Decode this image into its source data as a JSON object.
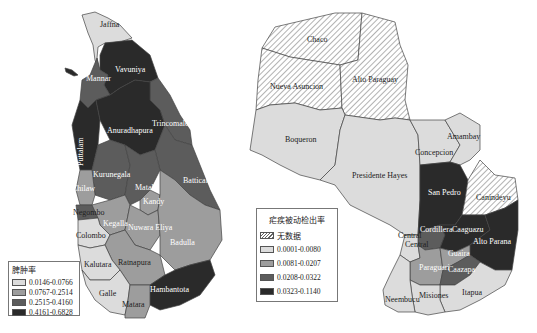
{
  "colors": {
    "class1": "#dcdcdc",
    "class2": "#9d9d9d",
    "class3": "#5c5c5c",
    "class4": "#2a2a2a",
    "no_data": "hatched",
    "border": "#555555"
  },
  "sri_lanka": {
    "legend": {
      "title": "脾肿率",
      "items": [
        {
          "range": "0.0146-0.0766",
          "color": "#dcdcdc"
        },
        {
          "range": "0.0767-0.2514",
          "color": "#9d9d9d"
        },
        {
          "range": "0.2515-0.4160",
          "color": "#5c5c5c"
        },
        {
          "range": "0.4161-0.6828",
          "color": "#2a2a2a"
        }
      ]
    },
    "districts": [
      {
        "name": "Jaffna",
        "class": 1
      },
      {
        "name": "Vavuniya",
        "class": 4
      },
      {
        "name": "Mannar",
        "class": 3
      },
      {
        "name": "Trincomalee",
        "class": 3
      },
      {
        "name": "Anuradhapura",
        "class": 4
      },
      {
        "name": "Puttalam",
        "class": 4
      },
      {
        "name": "Kurunegala",
        "class": 3
      },
      {
        "name": "Chilaw",
        "class": 2
      },
      {
        "name": "Matale",
        "class": 3
      },
      {
        "name": "Batticaloa",
        "class": 3
      },
      {
        "name": "Kandy",
        "class": 2
      },
      {
        "name": "Negombo",
        "class": 3
      },
      {
        "name": "Kegalla",
        "class": 2
      },
      {
        "name": "Nuwara Eliya",
        "class": 2
      },
      {
        "name": "Colombo",
        "class": 1
      },
      {
        "name": "Badulla",
        "class": 2
      },
      {
        "name": "Ratnapura",
        "class": 2
      },
      {
        "name": "Kalutara",
        "class": 1
      },
      {
        "name": "Hambantota",
        "class": 4
      },
      {
        "name": "Galle",
        "class": 1
      },
      {
        "name": "Matara",
        "class": 2
      }
    ]
  },
  "paraguay": {
    "legend": {
      "title": "疟疾被动检出率",
      "no_data_label": "无数据",
      "items": [
        {
          "range": "0.0001-0.0080",
          "color": "#dcdcdc"
        },
        {
          "range": "0.0081-0.0207",
          "color": "#9d9d9d"
        },
        {
          "range": "0.0208-0.0322",
          "color": "#5c5c5c"
        },
        {
          "range": "0.0323-0.1140",
          "color": "#2a2a2a"
        }
      ]
    },
    "departments": [
      {
        "name": "Chaco",
        "class": "no_data"
      },
      {
        "name": "Nueva Asuncion",
        "class": "no_data"
      },
      {
        "name": "Alto Paraguay",
        "class": "no_data"
      },
      {
        "name": "Boqueron",
        "class": 1
      },
      {
        "name": "Presidente Hayes",
        "class": 1
      },
      {
        "name": "Amambay",
        "class": 1
      },
      {
        "name": "Concepcion",
        "class": 1
      },
      {
        "name": "San Pedro",
        "class": 4
      },
      {
        "name": "Canindeyu",
        "class": "no_data"
      },
      {
        "name": "Cordillera",
        "class": 3
      },
      {
        "name": "Central",
        "class": 1
      },
      {
        "name": "Caaguazu",
        "class": 4
      },
      {
        "name": "Alto Parana",
        "class": 4
      },
      {
        "name": "Guaira",
        "class": 2
      },
      {
        "name": "Paraguari",
        "class": 2
      },
      {
        "name": "Caazapa",
        "class": 3
      },
      {
        "name": "Itapua",
        "class": 1
      },
      {
        "name": "Misiones",
        "class": 1
      },
      {
        "name": "Neembucu",
        "class": 1
      }
    ]
  }
}
